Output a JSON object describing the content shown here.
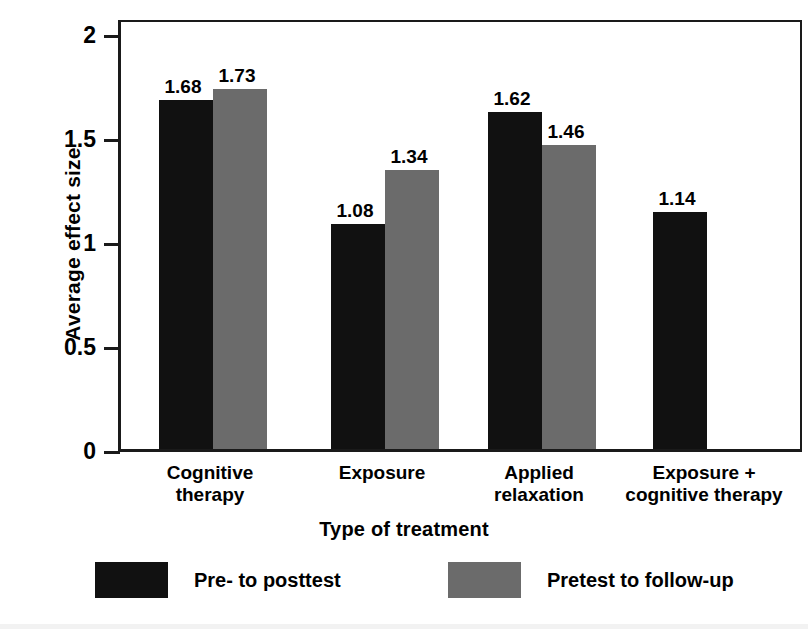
{
  "chart_data": {
    "type": "bar",
    "title": "",
    "xlabel": "Type of treatment",
    "ylabel": "Average effect size",
    "ylim": [
      0,
      2
    ],
    "yticks": [
      "0",
      "0.5",
      "1",
      "1.5",
      "2"
    ],
    "ytick_values": [
      0,
      0.5,
      1,
      1.5,
      2
    ],
    "grid": false,
    "legend_position": "bottom",
    "categories": [
      "Cognitive\ntherapy",
      "Exposure",
      "Applied\nrelaxation",
      "Exposure +\ncognitive therapy"
    ],
    "series": [
      {
        "name": "Pre- to posttest",
        "color": "#111111",
        "values": [
          1.68,
          1.08,
          1.62,
          1.14
        ],
        "labels": [
          "1.68",
          "1.08",
          "1.62",
          "1.14"
        ]
      },
      {
        "name": "Pretest to follow-up",
        "color": "#6b6b6b",
        "values": [
          1.73,
          1.34,
          1.46,
          null
        ],
        "labels": [
          "1.73",
          "1.34",
          "1.46",
          ""
        ]
      }
    ]
  },
  "axes": {
    "y_title": "Average effect size",
    "x_title": "Type of treatment",
    "y_ticks": [
      {
        "label": "2",
        "value": 2
      },
      {
        "label": "1.5",
        "value": 1.5
      },
      {
        "label": "1",
        "value": 1
      },
      {
        "label": "0.5",
        "value": 0.5
      },
      {
        "label": "0",
        "value": 0
      }
    ]
  },
  "categories": [
    {
      "label": "Cognitive\ntherapy"
    },
    {
      "label": "Exposure"
    },
    {
      "label": "Applied\nrelaxation"
    },
    {
      "label": "Exposure +\ncognitive therapy"
    }
  ],
  "bars": [
    {
      "group": 0,
      "series": "Pre- to posttest",
      "value": 1.68,
      "label": "1.68",
      "color": "#111111"
    },
    {
      "group": 0,
      "series": "Pretest to follow-up",
      "value": 1.73,
      "label": "1.73",
      "color": "#6b6b6b"
    },
    {
      "group": 1,
      "series": "Pre- to posttest",
      "value": 1.08,
      "label": "1.08",
      "color": "#111111"
    },
    {
      "group": 1,
      "series": "Pretest to follow-up",
      "value": 1.34,
      "label": "1.34",
      "color": "#6b6b6b"
    },
    {
      "group": 2,
      "series": "Pre- to posttest",
      "value": 1.62,
      "label": "1.62",
      "color": "#111111"
    },
    {
      "group": 2,
      "series": "Pretest to follow-up",
      "value": 1.46,
      "label": "1.46",
      "color": "#6b6b6b"
    },
    {
      "group": 3,
      "series": "Pre- to posttest",
      "value": 1.14,
      "label": "1.14",
      "color": "#111111"
    }
  ],
  "legend": [
    {
      "label": "Pre- to posttest",
      "color": "#111111",
      "swatch": "black-swatch"
    },
    {
      "label": "Pretest to follow-up",
      "color": "#6b6b6b",
      "swatch": "gray-swatch"
    }
  ]
}
